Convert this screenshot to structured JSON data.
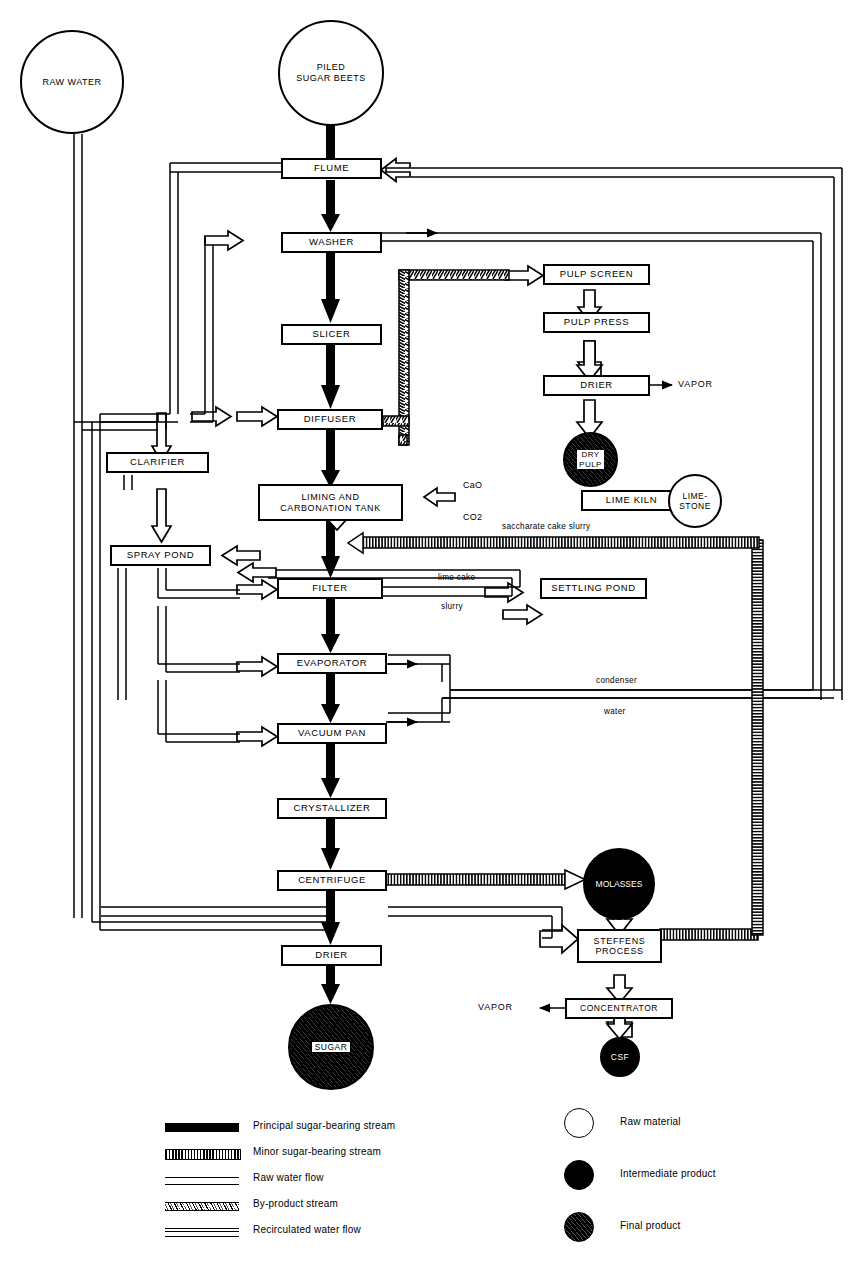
{
  "diagram": {
    "nodes": {
      "raw_water": "RAW WATER",
      "piled_sugar_beets": "PILED\nSUGAR BEETS",
      "flume": "FLUME",
      "washer": "WASHER",
      "slicer": "SLICER",
      "diffuser": "DIFFUSER",
      "clarifier": "CLARIFIER",
      "spray_pond": "SPRAY POND",
      "pulp_screen": "PULP SCREEN",
      "pulp_press": "PULP PRESS",
      "drier_pulp": "DRIER",
      "dry_pulp": "DRY\nPULP",
      "liming_tank": "LIMING AND\nCARBONATION TANK",
      "lime_kiln": "LIME KILN",
      "limestone": "LIME-\nSTONE",
      "filter": "FILTER",
      "settling_pond": "SETTLING POND",
      "evaporator": "EVAPORATOR",
      "vacuum_pan": "VACUUM PAN",
      "crystallizer": "CRYSTALLIZER",
      "centrifuge": "CENTRIFUGE",
      "molasses": "MOLASSES",
      "steffens_process": "STEFFENS\nPROCESS",
      "drier_sugar": "DRIER",
      "sugar": "SUGAR",
      "concentrator": "CONCENTRATOR",
      "csf": "CSF"
    },
    "stream_labels": {
      "vapor_pulp": "VAPOR",
      "vapor_concentrator": "VAPOR",
      "cao": "CaO",
      "co2": "CO2",
      "saccharate": "saccharate cake slurry",
      "lime_cake": "lime cake",
      "slurry": "slurry",
      "condenser": "condenser",
      "water": "water"
    }
  },
  "legend": {
    "streams": [
      {
        "key": "principal",
        "label": "Principal sugar-bearing stream"
      },
      {
        "key": "minor",
        "label": "Minor sugar-bearing stream"
      },
      {
        "key": "raw",
        "label": "Raw water flow"
      },
      {
        "key": "byproduct",
        "label": "By-product stream"
      },
      {
        "key": "recirculated",
        "label": "Recirculated water flow"
      }
    ],
    "materials": [
      {
        "key": "raw-material",
        "label": "Raw material"
      },
      {
        "key": "intermediate-product",
        "label": "Intermediate product"
      },
      {
        "key": "final-product",
        "label": "Final product"
      }
    ]
  },
  "colors": {
    "ink": "#000000",
    "paper": "#ffffff"
  }
}
